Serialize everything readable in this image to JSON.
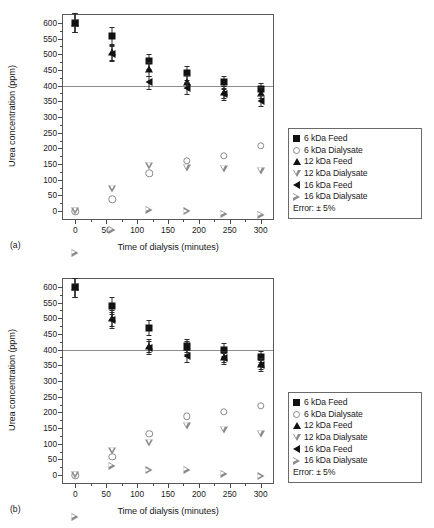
{
  "figure": {
    "panels": [
      {
        "tag": "(a)",
        "id": "a"
      },
      {
        "tag": "(b)",
        "id": "b"
      }
    ],
    "legend": {
      "entries": [
        {
          "label": "6 kDa Feed",
          "icon": "filled-square-icon"
        },
        {
          "label": "6 kDa Dialysate",
          "icon": "open-circle-icon"
        },
        {
          "label": "12 kDa Feed",
          "icon": "filled-triangle-up-icon"
        },
        {
          "label": "12 kDa Dialysate",
          "icon": "open-triangle-down-icon"
        },
        {
          "label": "16 kDa Feed",
          "icon": "filled-triangle-left-icon"
        },
        {
          "label": "16 kDa Dialysate",
          "icon": "open-triangle-right-icon"
        }
      ],
      "note": "Error: ± 5%"
    },
    "colors": {
      "filled_marker": "#111111",
      "open_marker": "#8a8a8a",
      "axis": "#5a5a5a",
      "reference_line": "#8d8d8d",
      "background": "#ffffff"
    }
  },
  "chart_data": [
    {
      "type": "scatter",
      "panel": "(a)",
      "title": "",
      "xlabel": "Time of dialysis (minutes)",
      "ylabel": "Urea concentration (ppm)",
      "xlim": [
        -20,
        320
      ],
      "ylim": [
        -25,
        625
      ],
      "xticks": [
        0,
        50,
        100,
        150,
        200,
        250,
        300
      ],
      "yticks": [
        0,
        50,
        100,
        150,
        200,
        250,
        300,
        350,
        400,
        450,
        500,
        550,
        600
      ],
      "grid": false,
      "reference_line": {
        "y": 400,
        "orientation": "horizontal"
      },
      "legend_position": "right-outside",
      "error_percent": 5,
      "x": [
        0,
        60,
        120,
        180,
        240,
        300
      ],
      "series": [
        {
          "name": "6 kDa Feed",
          "marker": "filled-square",
          "values": [
            600,
            558,
            478,
            440,
            410,
            388
          ]
        },
        {
          "name": "12 kDa Feed",
          "marker": "filled-triangle-up",
          "values": [
            600,
            508,
            453,
            412,
            380,
            378
          ]
        },
        {
          "name": "16 kDa Feed",
          "marker": "filled-triangle-left",
          "values": [
            600,
            502,
            410,
            392,
            374,
            352
          ]
        },
        {
          "name": "6 kDa Dialysate",
          "marker": "open-circle",
          "values": [
            0,
            38,
            120,
            160,
            177,
            208
          ]
        },
        {
          "name": "12 kDa Dialysate",
          "marker": "open-triangle-down",
          "values": [
            0,
            92,
            188,
            206,
            222,
            238
          ]
        },
        {
          "name": "16 kDa Dialysate",
          "marker": "open-triangle-right",
          "values": [
            0,
            100,
            190,
            210,
            228,
            250
          ]
        }
      ]
    },
    {
      "type": "scatter",
      "panel": "(b)",
      "title": "",
      "xlabel": "Time of dialysis (minutes)",
      "ylabel": "Urea concentration (ppm)",
      "xlim": [
        -20,
        320
      ],
      "ylim": [
        -25,
        625
      ],
      "xticks": [
        0,
        50,
        100,
        150,
        200,
        250,
        300
      ],
      "yticks": [
        0,
        50,
        100,
        150,
        200,
        250,
        300,
        350,
        400,
        450,
        500,
        550,
        600
      ],
      "grid": false,
      "reference_line": {
        "y": 400,
        "orientation": "horizontal"
      },
      "legend_position": "right-outside",
      "error_percent": 5,
      "x": [
        0,
        60,
        120,
        180,
        240,
        300
      ],
      "series": [
        {
          "name": "6 kDa Feed",
          "marker": "filled-square",
          "values": [
            598,
            540,
            470,
            412,
            400,
            378
          ]
        },
        {
          "name": "12 kDa Feed",
          "marker": "filled-triangle-up",
          "values": [
            598,
            500,
            412,
            408,
            378,
            355
          ]
        },
        {
          "name": "16 kDa Feed",
          "marker": "filled-triangle-left",
          "values": [
            598,
            494,
            406,
            380,
            372,
            350
          ]
        },
        {
          "name": "6 kDa Dialysate",
          "marker": "open-circle",
          "values": [
            0,
            58,
            132,
            188,
            202,
            220
          ]
        },
        {
          "name": "12 kDa Dialysate",
          "marker": "open-triangle-down",
          "values": [
            0,
            100,
            148,
            222,
            232,
            242
          ]
        },
        {
          "name": "16 kDa Dialysate",
          "marker": "open-triangle-right",
          "values": [
            0,
            190,
            200,
            228,
            240,
            258
          ]
        }
      ]
    }
  ]
}
